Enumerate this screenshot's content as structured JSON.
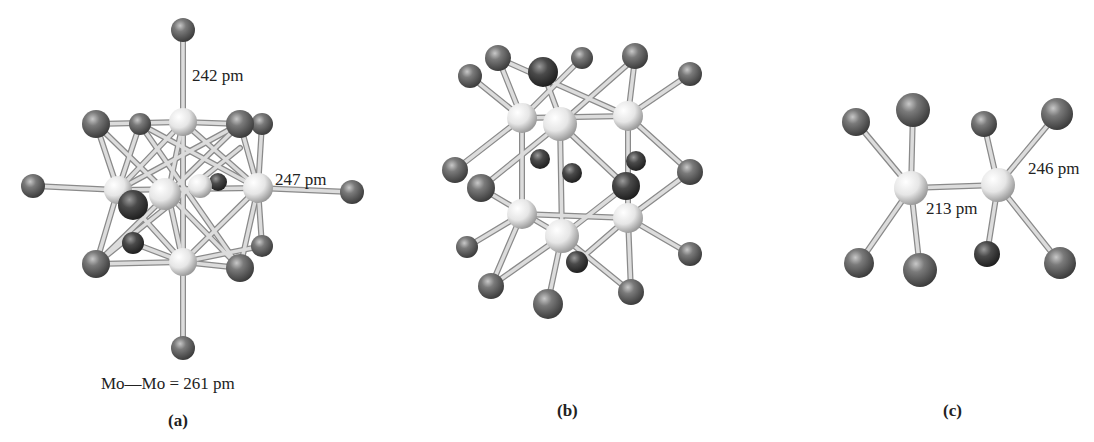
{
  "figure": {
    "panels": [
      {
        "id": "a",
        "caption": "(a)",
        "annotations": {
          "axial_bond": "242 pm",
          "equatorial_bond": "247 pm",
          "metal_metal": "Mo—Mo = 261 pm"
        },
        "description": "Octahedral Mo6 cluster with face-capping and terminal halide ligands"
      },
      {
        "id": "b",
        "caption": "(b)",
        "annotations": {},
        "description": "Trigonal prismatic metal cluster with edge-bridging and terminal ligands"
      },
      {
        "id": "c",
        "caption": "(c)",
        "annotations": {
          "metal_ligand_bond": "246 pm",
          "metal_metal_bond": "213 pm"
        },
        "description": "Dinuclear metal complex with eclipsed ligand arrangement"
      }
    ],
    "colors": {
      "metal_atom": "#e8e8e8",
      "ligand_atom": "#6a6a6a",
      "bond": "#d8d8d8",
      "bond_outline": "#8a8a8a",
      "text": "#222222"
    }
  }
}
